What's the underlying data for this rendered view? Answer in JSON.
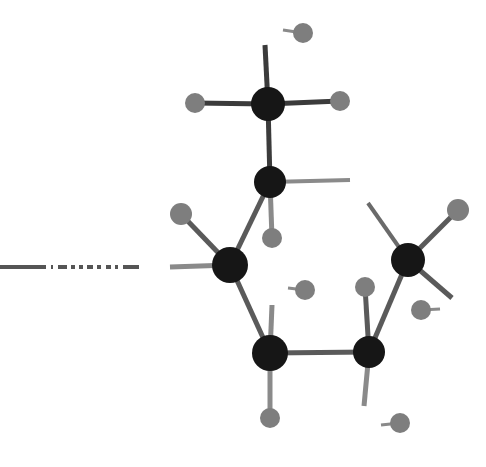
{
  "figure": {
    "kind": "molecular-structure-diagram",
    "representation": "ball-and-stick",
    "title": "",
    "caption": "",
    "background_color": "#ffffff",
    "width": 486,
    "height": 467
  },
  "palette": {
    "carbon_color": "#161616",
    "hydrogen_color": "#7e7e7e",
    "bond_color_dark": "#3b3b3b",
    "bond_color_light": "#8a8a8a",
    "dashed_line_color": "#555555"
  },
  "atoms": [
    {
      "id": "C1",
      "element": "C",
      "label": "",
      "x": 268,
      "y": 104,
      "r": 17,
      "color": "#161616",
      "kind": "carbon"
    },
    {
      "id": "C2",
      "element": "C",
      "label": "",
      "x": 270,
      "y": 182,
      "r": 16,
      "color": "#161616",
      "kind": "carbon"
    },
    {
      "id": "C3",
      "element": "C",
      "label": "",
      "x": 230,
      "y": 265,
      "r": 18,
      "color": "#161616",
      "kind": "carbon"
    },
    {
      "id": "C4",
      "element": "C",
      "label": "",
      "x": 270,
      "y": 353,
      "r": 18,
      "color": "#161616",
      "kind": "carbon"
    },
    {
      "id": "C5",
      "element": "C",
      "label": "",
      "x": 369,
      "y": 352,
      "r": 16,
      "color": "#161616",
      "kind": "carbon"
    },
    {
      "id": "C6",
      "element": "C",
      "label": "",
      "x": 408,
      "y": 260,
      "r": 17,
      "color": "#161616",
      "kind": "carbon"
    },
    {
      "id": "H1",
      "element": "H",
      "label": "",
      "x": 195,
      "y": 103,
      "r": 10,
      "color": "#7e7e7e",
      "kind": "hydrogen"
    },
    {
      "id": "H2",
      "element": "H",
      "label": "",
      "x": 340,
      "y": 101,
      "r": 10,
      "color": "#7e7e7e",
      "kind": "hydrogen"
    },
    {
      "id": "H3",
      "element": "H",
      "label": "",
      "x": 303,
      "y": 33,
      "r": 10,
      "color": "#7e7e7e",
      "kind": "hydrogen"
    },
    {
      "id": "H4",
      "element": "H",
      "label": "",
      "x": 272,
      "y": 238,
      "r": 10,
      "color": "#7e7e7e",
      "kind": "hydrogen"
    },
    {
      "id": "H5",
      "element": "H",
      "label": "",
      "x": 181,
      "y": 214,
      "r": 11,
      "color": "#7e7e7e",
      "kind": "hydrogen"
    },
    {
      "id": "H6",
      "element": "H",
      "label": "",
      "x": 305,
      "y": 290,
      "r": 10,
      "color": "#7e7e7e",
      "kind": "hydrogen"
    },
    {
      "id": "H7",
      "element": "H",
      "label": "",
      "x": 365,
      "y": 287,
      "r": 10,
      "color": "#7e7e7e",
      "kind": "hydrogen"
    },
    {
      "id": "H8",
      "element": "H",
      "label": "",
      "x": 270,
      "y": 418,
      "r": 10,
      "color": "#7e7e7e",
      "kind": "hydrogen"
    },
    {
      "id": "H9",
      "element": "H",
      "label": "",
      "x": 400,
      "y": 423,
      "r": 10,
      "color": "#7e7e7e",
      "kind": "hydrogen"
    },
    {
      "id": "H10",
      "element": "H",
      "label": "",
      "x": 458,
      "y": 210,
      "r": 11,
      "color": "#7e7e7e",
      "kind": "hydrogen"
    },
    {
      "id": "H11",
      "element": "H",
      "label": "",
      "x": 421,
      "y": 310,
      "r": 10,
      "color": "#7e7e7e",
      "kind": "hydrogen"
    }
  ],
  "bonds": [
    {
      "id": "b-C1-H1",
      "from": "C1",
      "to": "H1",
      "x1": 268,
      "y1": 104,
      "x2": 195,
      "y2": 103,
      "width": 5,
      "color": "#3b3b3b",
      "style": "solid"
    },
    {
      "id": "b-C1-H2",
      "from": "C1",
      "to": "H2",
      "x1": 268,
      "y1": 104,
      "x2": 340,
      "y2": 101,
      "width": 5,
      "color": "#3b3b3b",
      "style": "solid"
    },
    {
      "id": "b-C1-open-up",
      "from": "C1",
      "to": "open",
      "x1": 268,
      "y1": 104,
      "x2": 265,
      "y2": 45,
      "width": 5,
      "color": "#3b3b3b",
      "style": "solid"
    },
    {
      "id": "b-C1-C2",
      "from": "C1",
      "to": "C2",
      "x1": 268,
      "y1": 104,
      "x2": 270,
      "y2": 182,
      "width": 5,
      "color": "#3b3b3b",
      "style": "solid"
    },
    {
      "id": "b-C2-open-right",
      "from": "C2",
      "to": "open",
      "x1": 270,
      "y1": 182,
      "x2": 350,
      "y2": 180,
      "width": 4,
      "color": "#8a8a8a",
      "style": "solid"
    },
    {
      "id": "b-C2-H4",
      "from": "C2",
      "to": "H4",
      "x1": 270,
      "y1": 182,
      "x2": 272,
      "y2": 238,
      "width": 5,
      "color": "#8a8a8a",
      "style": "solid"
    },
    {
      "id": "b-C2-C3",
      "from": "C2",
      "to": "C3",
      "x1": 270,
      "y1": 182,
      "x2": 230,
      "y2": 265,
      "width": 5,
      "color": "#5a5a5a",
      "style": "solid"
    },
    {
      "id": "b-C3-H5",
      "from": "C3",
      "to": "H5",
      "x1": 230,
      "y1": 265,
      "x2": 181,
      "y2": 214,
      "width": 5,
      "color": "#5a5a5a",
      "style": "solid"
    },
    {
      "id": "b-C3-open-left",
      "from": "C3",
      "to": "open",
      "x1": 230,
      "y1": 265,
      "x2": 170,
      "y2": 267,
      "width": 5,
      "color": "#8a8a8a",
      "style": "solid"
    },
    {
      "id": "b-C3-C4",
      "from": "C3",
      "to": "C4",
      "x1": 230,
      "y1": 265,
      "x2": 270,
      "y2": 353,
      "width": 5,
      "color": "#5a5a5a",
      "style": "solid"
    },
    {
      "id": "b-C4-C5",
      "from": "C4",
      "to": "C5",
      "x1": 270,
      "y1": 353,
      "x2": 369,
      "y2": 352,
      "width": 5,
      "color": "#5a5a5a",
      "style": "solid"
    },
    {
      "id": "b-C4-H8",
      "from": "C4",
      "to": "H8",
      "x1": 270,
      "y1": 353,
      "x2": 270,
      "y2": 418,
      "width": 5,
      "color": "#8a8a8a",
      "style": "solid"
    },
    {
      "id": "b-C4-open-up",
      "from": "C4",
      "to": "open",
      "x1": 270,
      "y1": 353,
      "x2": 272,
      "y2": 305,
      "width": 5,
      "color": "#8a8a8a",
      "style": "solid"
    },
    {
      "id": "b-C5-H7",
      "from": "C5",
      "to": "H7",
      "x1": 369,
      "y1": 352,
      "x2": 365,
      "y2": 287,
      "width": 5,
      "color": "#5a5a5a",
      "style": "solid"
    },
    {
      "id": "b-C5-C6",
      "from": "C5",
      "to": "C6",
      "x1": 369,
      "y1": 352,
      "x2": 408,
      "y2": 260,
      "width": 5,
      "color": "#5a5a5a",
      "style": "solid"
    },
    {
      "id": "b-C5-open-down",
      "from": "C5",
      "to": "open",
      "x1": 369,
      "y1": 352,
      "x2": 364,
      "y2": 406,
      "width": 5,
      "color": "#8a8a8a",
      "style": "solid"
    },
    {
      "id": "b-C6-H10",
      "from": "C6",
      "to": "H10",
      "x1": 408,
      "y1": 260,
      "x2": 458,
      "y2": 210,
      "width": 5,
      "color": "#5a5a5a",
      "style": "solid"
    },
    {
      "id": "b-C6-open-upleft",
      "from": "C6",
      "to": "open",
      "x1": 408,
      "y1": 260,
      "x2": 368,
      "y2": 203,
      "width": 4,
      "color": "#6a6a6a",
      "style": "solid"
    },
    {
      "id": "b-C6-open-downright",
      "from": "C6",
      "to": "open",
      "x1": 408,
      "y1": 260,
      "x2": 452,
      "y2": 298,
      "width": 5,
      "color": "#5a5a5a",
      "style": "solid"
    },
    {
      "id": "b-H3-stub",
      "from": "H3",
      "to": "open",
      "x1": 303,
      "y1": 33,
      "x2": 283,
      "y2": 30,
      "width": 3,
      "color": "#8a8a8a",
      "style": "solid"
    },
    {
      "id": "b-H6-stub",
      "from": "H6",
      "to": "open",
      "x1": 305,
      "y1": 290,
      "x2": 288,
      "y2": 288,
      "width": 3,
      "color": "#8a8a8a",
      "style": "solid"
    },
    {
      "id": "b-H9-stub",
      "from": "H9",
      "to": "open",
      "x1": 400,
      "y1": 423,
      "x2": 381,
      "y2": 425,
      "width": 3,
      "color": "#8a8a8a",
      "style": "solid"
    },
    {
      "id": "b-H11-stub",
      "from": "H11",
      "to": "open",
      "x1": 421,
      "y1": 310,
      "x2": 440,
      "y2": 309,
      "width": 3,
      "color": "#8a8a8a",
      "style": "solid"
    }
  ],
  "dashed_line": {
    "id": "left-dashed-bond",
    "description": "broken horizontal line entering from left edge",
    "x1": 0,
    "y1": 267,
    "x2": 146,
    "y2": 267,
    "width": 4,
    "color": "#555555",
    "dash_pattern": "46 5 2 5 9 4 4 4 4 4 6 4 4 5 5 4 3 5 16"
  }
}
